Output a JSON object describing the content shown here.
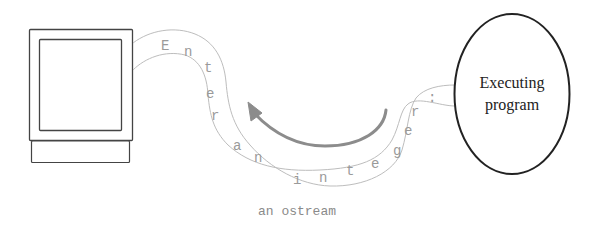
{
  "diagram": {
    "program": {
      "label_line1": "Executing",
      "label_line2": "program"
    },
    "stream": {
      "caption": "an ostream",
      "characters": [
        "E",
        "n",
        "t",
        "e",
        "r",
        "a",
        "n",
        "i",
        "n",
        "t",
        "e",
        "g",
        "e",
        "r",
        ":"
      ],
      "text": "Enter an integer:"
    },
    "colors": {
      "outline": "#333333",
      "stream_line": "#bbbbbb",
      "stream_text": "#999999",
      "arrow": "#8c8c8c",
      "ellipse": "#222222"
    }
  }
}
